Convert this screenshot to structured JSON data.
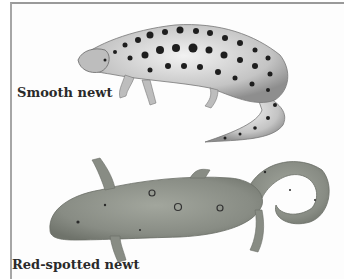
{
  "figure": {
    "animals": [
      {
        "label": "Smooth newt",
        "body_color": "#c9c9c9",
        "spot_color": "#1e1e1e",
        "appearance": "pale gray-white body with many large black spots, crested back"
      },
      {
        "label": "Red-spotted newt",
        "body_color": "#8c9088",
        "spot_color": "#2a2a2a",
        "appearance": "muted gray-green body with small dark-ringed spots, curled tail"
      }
    ],
    "border_color": "#9a9a9a"
  }
}
